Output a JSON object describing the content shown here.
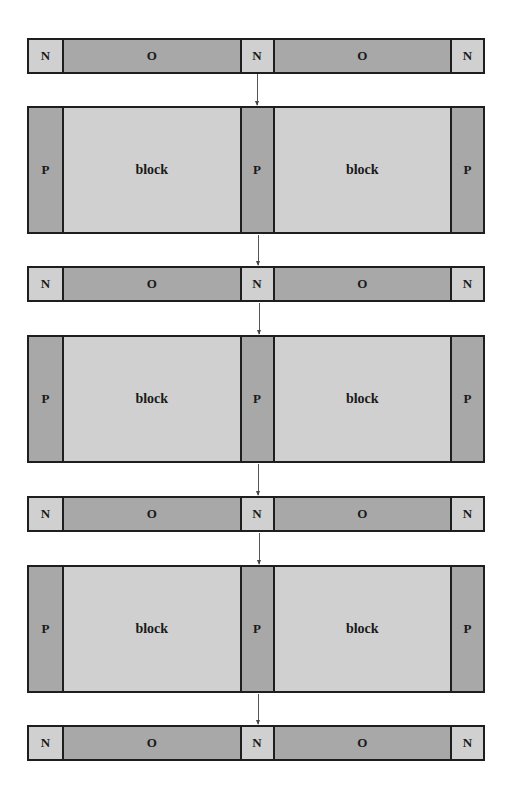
{
  "colors": {
    "light": "#d0d0d0",
    "dark": "#a8a8a8",
    "border": "#1e1e1e"
  },
  "strips": [
    {
      "cells": [
        "N",
        "O",
        "N",
        "O",
        "N"
      ]
    },
    {
      "cells": [
        "N",
        "O",
        "N",
        "O",
        "N"
      ]
    },
    {
      "cells": [
        "N",
        "O",
        "N",
        "O",
        "N"
      ]
    },
    {
      "cells": [
        "N",
        "O",
        "N",
        "O",
        "N"
      ]
    }
  ],
  "blocks": [
    {
      "cells": [
        "P",
        "block",
        "P",
        "block",
        "P"
      ]
    },
    {
      "cells": [
        "P",
        "block",
        "P",
        "block",
        "P"
      ]
    },
    {
      "cells": [
        "P",
        "block",
        "P",
        "block",
        "P"
      ]
    }
  ]
}
